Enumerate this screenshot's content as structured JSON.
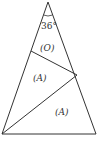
{
  "diagram": {
    "type": "geometry-triangle",
    "stroke_color": "#333333",
    "background": "#ffffff",
    "vertices": {
      "apex": [
        48,
        2
      ],
      "bottom_left": [
        2,
        134
      ],
      "bottom_right": [
        96,
        134
      ],
      "left_side_point": [
        31,
        51
      ],
      "right_side_point": [
        77,
        75
      ]
    },
    "segments": [
      {
        "from": "left_side_point",
        "to": "right_side_point"
      },
      {
        "from": "bottom_left",
        "to": "right_side_point"
      }
    ],
    "labels": {
      "apex_angle": "36°",
      "top_region": "(O)",
      "middle_region": "(A)",
      "bottom_region": "(A)"
    }
  }
}
